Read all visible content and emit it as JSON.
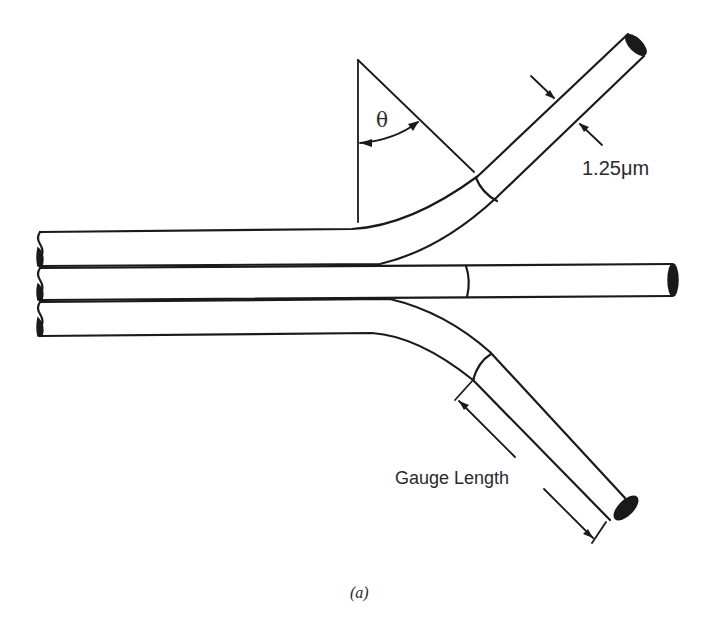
{
  "diagram": {
    "type": "fiber-bundle-schematic",
    "labels": {
      "angle": "θ",
      "diameter": "1.25μm",
      "gauge_length": "Gauge Length",
      "caption": "(a)"
    },
    "elements": [
      {
        "id": "fiber-top",
        "kind": "bent-fiber",
        "direction": "up-right"
      },
      {
        "id": "fiber-middle",
        "kind": "straight-fiber",
        "direction": "right"
      },
      {
        "id": "fiber-bottom",
        "kind": "bent-fiber",
        "direction": "down-right"
      },
      {
        "id": "angle-marker",
        "kind": "angle-arc",
        "label_ref": "angle"
      },
      {
        "id": "diameter-marker",
        "kind": "dimension-arrows",
        "label_ref": "diameter"
      },
      {
        "id": "gauge-marker",
        "kind": "dimension-line",
        "label_ref": "gauge_length"
      }
    ],
    "colors": {
      "stroke": "#1a1a1a",
      "background": "#ffffff"
    }
  }
}
